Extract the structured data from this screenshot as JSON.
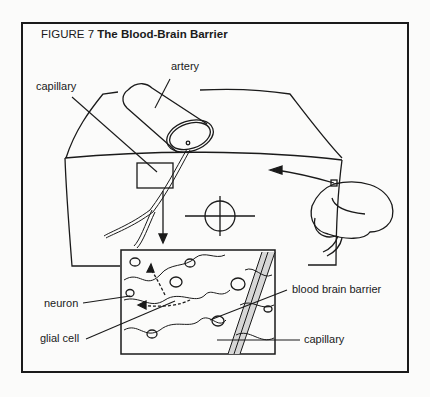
{
  "figure": {
    "number_label": "FIGURE 7",
    "title": "The Blood-Brain Barrier"
  },
  "labels": {
    "artery": "artery",
    "capillary_top": "capillary",
    "neuron": "neuron",
    "glial_cell": "glial cell",
    "blood_brain_barrier": "blood brain barrier",
    "capillary_bottom": "capillary"
  },
  "colors": {
    "line": "#1a1a1a",
    "background": "#fbfbfa",
    "capillary_fill": "#d8d8d8"
  }
}
